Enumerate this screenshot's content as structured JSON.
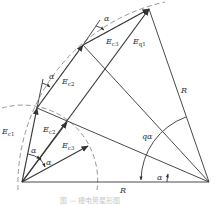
{
  "diagram": {
    "labels": {
      "Ec1": "E",
      "Ec1_sub": "c1",
      "Ec2_inner": "E",
      "Ec2_inner_sub": "c2",
      "Ec3_inner": "E",
      "Ec3_inner_sub": "c3",
      "Ec2_outer": "E",
      "Ec2_outer_sub": "c2",
      "Ec3_outer": "E",
      "Ec3_outer_sub": "c3",
      "Eq1": "E",
      "Eq1_sub": "q1",
      "R_bottom": "R",
      "R_right": "R",
      "q_alpha": "qα",
      "alpha": "α"
    },
    "caption": "图 — 槽电势星形图"
  }
}
